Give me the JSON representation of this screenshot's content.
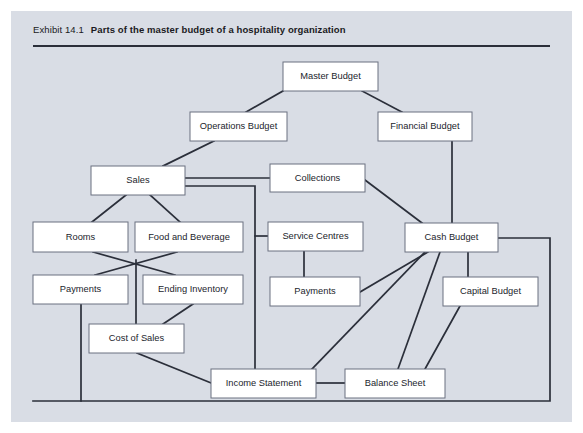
{
  "exhibit": {
    "label": "Exhibit 14.1",
    "title": "Parts of the master budget of a hospitality organization",
    "panel_color": "#d9dde5",
    "rule_color": "#2b2f3a"
  },
  "diagram": {
    "type": "flowchart",
    "node_fill": "#ffffff",
    "node_stroke": "#6b7180",
    "edge_color": "#2b2f3a",
    "nodes": [
      {
        "id": "master_budget",
        "label": "Master Budget",
        "x": 283,
        "y": 62,
        "w": 95,
        "h": 29
      },
      {
        "id": "operations_budget",
        "label": "Operations Budget",
        "x": 190,
        "y": 112,
        "w": 97,
        "h": 29
      },
      {
        "id": "financial_budget",
        "label": "Financial Budget",
        "x": 378,
        "y": 112,
        "w": 94,
        "h": 29
      },
      {
        "id": "sales",
        "label": "Sales",
        "x": 91,
        "y": 166,
        "w": 94,
        "h": 29
      },
      {
        "id": "collections",
        "label": "Collections",
        "x": 270,
        "y": 164,
        "w": 95,
        "h": 28
      },
      {
        "id": "rooms",
        "label": "Rooms",
        "x": 33,
        "y": 222,
        "w": 95,
        "h": 30
      },
      {
        "id": "food_and_beverage",
        "label": "Food and Beverage",
        "x": 135,
        "y": 222,
        "w": 108,
        "h": 30
      },
      {
        "id": "service_centres",
        "label": "Service Centres",
        "x": 268,
        "y": 222,
        "w": 95,
        "h": 29
      },
      {
        "id": "cash_budget",
        "label": "Cash Budget",
        "x": 405,
        "y": 223,
        "w": 93,
        "h": 29
      },
      {
        "id": "payments_left",
        "label": "Payments",
        "x": 33,
        "y": 275,
        "w": 95,
        "h": 29
      },
      {
        "id": "ending_inventory",
        "label": "Ending Inventory",
        "x": 143,
        "y": 275,
        "w": 100,
        "h": 29
      },
      {
        "id": "payments_right",
        "label": "Payments",
        "x": 270,
        "y": 277,
        "w": 90,
        "h": 29
      },
      {
        "id": "capital_budget",
        "label": "Capital Budget",
        "x": 443,
        "y": 277,
        "w": 95,
        "h": 29
      },
      {
        "id": "cost_of_sales",
        "label": "Cost of Sales",
        "x": 89,
        "y": 324,
        "w": 95,
        "h": 29
      },
      {
        "id": "income_statement",
        "label": "Income Statement",
        "x": 211,
        "y": 369,
        "w": 105,
        "h": 29
      },
      {
        "id": "balance_sheet",
        "label": "Balance Sheet",
        "x": 345,
        "y": 369,
        "w": 100,
        "h": 29
      }
    ],
    "edges": [
      {
        "id": "master-to-operations",
        "from": "master_budget",
        "to": "operations_budget",
        "points": "283,91 246,112"
      },
      {
        "id": "master-to-financial",
        "from": "master_budget",
        "to": "financial_budget",
        "points": "362,91 402,112"
      },
      {
        "id": "operations-to-sales",
        "from": "operations_budget",
        "to": "sales",
        "points": "214,141 163,166"
      },
      {
        "id": "financial-to-cash",
        "from": "financial_budget",
        "to": "cash_budget",
        "points": "452,141 452,223"
      },
      {
        "id": "sales-to-collections",
        "from": "sales",
        "to": "collections",
        "points": "185,178 270,178"
      },
      {
        "id": "sales-to-income-statement",
        "from": "sales",
        "to": "income_statement",
        "points": "185,186 255,186 255,369"
      },
      {
        "id": "sales-to-rooms",
        "from": "sales",
        "to": "rooms",
        "points": "126,195 92,222"
      },
      {
        "id": "sales-to-food-beverage",
        "from": "sales",
        "to": "food_and_beverage",
        "points": "150,195 180,222"
      },
      {
        "id": "trunk-to-service-centres",
        "from": "sales",
        "to": "service_centres",
        "points": "255,236 268,236"
      },
      {
        "id": "rooms-to-ending-inventory",
        "from": "rooms",
        "to": "ending_inventory",
        "points": "93,252 175,275"
      },
      {
        "id": "food-beverage-to-payments",
        "from": "food_and_beverage",
        "to": "payments_left",
        "points": "177,252 95,275"
      },
      {
        "id": "cross-to-cost-of-sales",
        "from": "food_and_beverage",
        "to": "cost_of_sales",
        "points": "136,260 136,324"
      },
      {
        "id": "collections-to-cash",
        "from": "collections",
        "to": "cash_budget",
        "points": "365,180 422,223"
      },
      {
        "id": "service-centres-to-payments",
        "from": "service_centres",
        "to": "payments_right",
        "points": "304,251 304,277"
      },
      {
        "id": "payments-right-to-cash",
        "from": "payments_right",
        "to": "cash_budget",
        "points": "360,292 428,252"
      },
      {
        "id": "cash-to-capital-budget",
        "from": "cash_budget",
        "to": "capital_budget",
        "points": "468,252 468,277"
      },
      {
        "id": "cash-to-balance-sheet",
        "from": "cash_budget",
        "to": "balance_sheet",
        "points": "440,252 398,369"
      },
      {
        "id": "cash-to-income-statement",
        "from": "cash_budget",
        "to": "income_statement",
        "points": "425,252 312,369"
      },
      {
        "id": "capital-to-balance-sheet",
        "from": "capital_budget",
        "to": "balance_sheet",
        "points": "460,306 425,369"
      },
      {
        "id": "cash-budget-outer-loop",
        "from": "cash_budget",
        "to": "loop",
        "points": "498,238 550,238 550,401 33,401"
      },
      {
        "id": "payments-left-loop",
        "from": "payments_left",
        "to": "loop",
        "points": "81,304 81,401"
      },
      {
        "id": "ending-inventory-to-cost",
        "from": "ending_inventory",
        "to": "cost_of_sales",
        "points": "193,304 163,324"
      },
      {
        "id": "cost-of-sales-to-income",
        "from": "cost_of_sales",
        "to": "income_statement",
        "points": "137,353 211,383"
      },
      {
        "id": "income-to-balance-sheet",
        "from": "income_statement",
        "to": "balance_sheet",
        "points": "316,383 345,383"
      }
    ]
  }
}
